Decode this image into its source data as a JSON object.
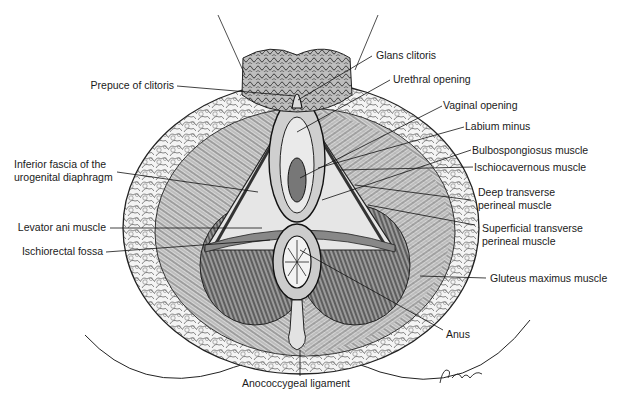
{
  "figure": {
    "type": "anatomical-illustration",
    "signature": "Penkhus"
  },
  "labels": {
    "left": [
      {
        "id": "prepuce",
        "text": "Prepuce of clitoris"
      },
      {
        "id": "inferior_fascia_1",
        "text": "Inferior fascia of the"
      },
      {
        "id": "inferior_fascia_2",
        "text": "urogenital diaphragm"
      },
      {
        "id": "levator_ani",
        "text": "Levator ani muscle"
      },
      {
        "id": "ischiorectal",
        "text": "Ischiorectal fossa"
      }
    ],
    "right": [
      {
        "id": "glans",
        "text": "Glans clitoris"
      },
      {
        "id": "urethral",
        "text": "Urethral opening"
      },
      {
        "id": "vaginal",
        "text": "Vaginal opening"
      },
      {
        "id": "labium",
        "text": "Labium minus"
      },
      {
        "id": "bulbospongiosus",
        "text": "Bulbospongiosus muscle"
      },
      {
        "id": "ischiocavernous",
        "text": "Ischiocavernous muscle"
      },
      {
        "id": "deep_transverse_1",
        "text": "Deep transverse"
      },
      {
        "id": "deep_transverse_2",
        "text": "perineal muscle"
      },
      {
        "id": "superficial_transverse_1",
        "text": "Superficial transverse"
      },
      {
        "id": "superficial_transverse_2",
        "text": "perineal muscle"
      },
      {
        "id": "gluteus",
        "text": "Gluteus maximus muscle"
      },
      {
        "id": "anus",
        "text": "Anus"
      }
    ],
    "bottom": [
      {
        "id": "anococcygeal",
        "text": "Anococcygeal ligament"
      }
    ]
  }
}
